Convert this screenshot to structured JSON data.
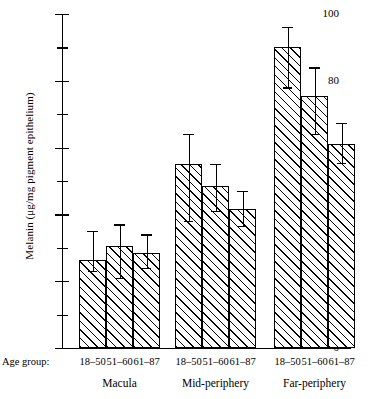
{
  "chart_data": {
    "type": "bar",
    "title": "",
    "xlabel": "Age group:",
    "ylabel": "Melanin (μg/mg pigment epithelium)",
    "ylim": [
      0,
      100
    ],
    "ytick_values": [
      0,
      20,
      40,
      60,
      80,
      100
    ],
    "ytick_labels": [
      "0",
      "20",
      "40",
      "60",
      "80",
      "100"
    ],
    "yminor_ticks": [
      10,
      30,
      50,
      70,
      90
    ],
    "grid": false,
    "legend": "none",
    "categories": [
      "18–50",
      "51–60",
      "61–87"
    ],
    "groups": [
      "Macula",
      "Mid-periphery",
      "Far-periphery"
    ],
    "series": [
      {
        "name": "Macula",
        "categories": [
          "18–50",
          "51–60",
          "61–87"
        ],
        "values": [
          26.5,
          30.5,
          28.5
        ],
        "err_upper": [
          8.5,
          6.5,
          5.5
        ],
        "err_lower": [
          3.5,
          9.5,
          4.5
        ]
      },
      {
        "name": "Mid-periphery",
        "categories": [
          "18–50",
          "51–60",
          "61–87"
        ],
        "values": [
          55.0,
          48.5,
          41.5
        ],
        "err_upper": [
          9.0,
          6.5,
          5.5
        ],
        "err_lower": [
          17.0,
          7.5,
          5.0
        ]
      },
      {
        "name": "Far-periphery",
        "categories": [
          "18–50",
          "51–60",
          "61–87"
        ],
        "values": [
          90.0,
          75.5,
          61.0
        ],
        "err_upper": [
          6.0,
          8.5,
          6.5
        ],
        "err_lower": [
          12.0,
          11.5,
          5.5
        ]
      }
    ]
  },
  "axis": {
    "x_prefix_label": "Age group:",
    "y_title": "Melanin (μg/mg pigment epithelium)"
  },
  "style": {
    "bar_face": "#ffffff",
    "bar_edge": "#000000",
    "hatch": "diagonal-45",
    "axis_color": "#000000",
    "background": "#ffffff"
  }
}
